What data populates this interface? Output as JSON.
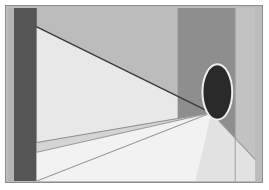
{
  "image": {
    "title": "Perspective interior with dark portal",
    "subject": "minimal one-point perspective room with doorway ellipse and floor light beam",
    "width": 269,
    "height": 190,
    "background_color": "#ffffff",
    "frame": {
      "x": 5,
      "y": 5,
      "width": 258,
      "height": 178,
      "border_color": "#8c8c8c",
      "border_width": 1
    },
    "vanishing_point": {
      "x": 212,
      "y": 113
    },
    "palette": {
      "page_white": "#ffffff",
      "frame_border": "#8c8c8c",
      "left_dark_band": "#555555",
      "left_edge_highlight": "#b4b4b4",
      "ceiling_gray": "#bcbcbc",
      "back_wall_dark": "#8e8e8e",
      "right_wall_light": "#c2c2c2",
      "left_wall_pale": "#e8e8e8",
      "floor_light": "#e2e2e2",
      "floor_shadow": "#d2d2d2",
      "beam_bright": "#f0f0f0",
      "portal_fill": "#2a2a2a",
      "portal_outline": "#efefef",
      "line_dark": "#3a3a3a",
      "line_soft": "#9a9a9a"
    },
    "regions": [
      {
        "name": "ceiling-plane",
        "description": "upper medium gray ceiling wedge",
        "color": "#bcbcbc",
        "points": "36,7 236,7 236,113 36,26"
      },
      {
        "name": "left-dark-band",
        "description": "dark vertical column at far left",
        "color": "#555555",
        "points": "13,7 36,7 36,182 13,182"
      },
      {
        "name": "left-edge-highlight",
        "description": "pale sliver left of dark band",
        "color": "#b4b4b4",
        "points": "7,7 13,7 13,182 7,182"
      },
      {
        "name": "left-wall-plane",
        "description": "pale left wall between top diagonal and floor",
        "color": "#e8e8e8",
        "points": "36,26 212,113 36,143"
      },
      {
        "name": "back-wall-dark",
        "description": "darker vertical band at back of room",
        "color": "#8e8e8e",
        "points": "178,7 236,7 236,160 178,160"
      },
      {
        "name": "right-wall-light",
        "description": "lighter vertical strip at far right",
        "color": "#c2c2c2",
        "points": "236,7 256,7 256,182 236,182"
      },
      {
        "name": "floor-plane",
        "description": "bright floor filling lower area",
        "color": "#e2e2e2",
        "points": "36,143 212,113 256,160 256,182 36,182"
      },
      {
        "name": "floor-shadow-wedge",
        "description": "slightly darker floor region upper right of beam",
        "color": "#d4d4d4",
        "points": "36,143 212,113 100,182 36,182"
      },
      {
        "name": "light-beam",
        "description": "bright angled band of light across the floor",
        "color": "#f2f2f2",
        "points": "36,153 212,113 196,182 36,182"
      }
    ],
    "lines": [
      {
        "name": "ceiling-perspective-line",
        "description": "strong dark diagonal from upper-left corner to vanishing point",
        "color": "#3a3a3a",
        "width": 1.4,
        "x1": 36,
        "y1": 26,
        "x2": 212,
        "y2": 113
      },
      {
        "name": "floor-wall-perspective-line",
        "description": "soft diagonal from left wall base to vanishing point",
        "color": "#8e8e8e",
        "width": 1.1,
        "x1": 36,
        "y1": 143,
        "x2": 212,
        "y2": 113
      },
      {
        "name": "beam-upper-edge-line",
        "description": "upper boundary of the floor light beam",
        "color": "#9a9a9a",
        "width": 1.1,
        "x1": 36,
        "y1": 153,
        "x2": 212,
        "y2": 113
      },
      {
        "name": "beam-lower-edge-line",
        "description": "lower boundary of the floor light beam running off bottom",
        "color": "#9a9a9a",
        "width": 1.1,
        "x1": 36,
        "y1": 182,
        "x2": 212,
        "y2": 113
      },
      {
        "name": "right-floor-perspective-line",
        "description": "short line from vanishing point toward lower right",
        "color": "#9a9a9a",
        "width": 1.1,
        "x1": 212,
        "y1": 113,
        "x2": 256,
        "y2": 160
      },
      {
        "name": "back-wall-left-edge",
        "description": "vertical seam where back wall meets right wall",
        "color": "#a0a0a0",
        "width": 1.0,
        "x1": 236,
        "y1": 7,
        "x2": 236,
        "y2": 182
      }
    ],
    "portal": {
      "name": "dark-portal-ellipse",
      "description": "dark vertical ellipse (doorway / figure) with light outline",
      "center_x": 218,
      "center_y": 92,
      "radius_x": 15,
      "radius_y": 28,
      "fill": "#2a2a2a",
      "outline": "#efefef",
      "outline_width": 2
    }
  }
}
